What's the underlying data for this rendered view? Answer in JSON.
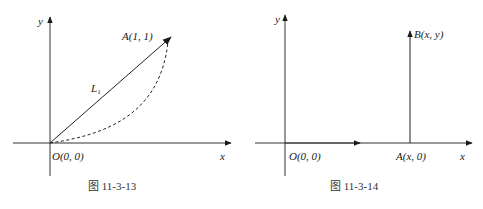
{
  "figures": [
    {
      "id": "fig-11-3-13",
      "caption": "图 11-3-13",
      "axis_labels": {
        "x": "x",
        "y": "y"
      },
      "points": {
        "origin": {
          "label": "O(0, 0)"
        },
        "A": {
          "label": "A(1, 1)"
        }
      },
      "paths": {
        "L1": {
          "label_main": "L",
          "label_sub": "1",
          "style": "solid",
          "description": "straight segment from O to A with arrowhead at A"
        },
        "curve": {
          "style": "dashed",
          "description": "curved path from O bowing below L1, ending at A"
        }
      },
      "colors": {
        "line": "#222222",
        "background": "#ffffff"
      }
    },
    {
      "id": "fig-11-3-14",
      "caption": "图 11-3-14",
      "axis_labels": {
        "x": "x",
        "y": "y"
      },
      "points": {
        "origin": {
          "label": "O(0, 0)"
        },
        "A": {
          "label": "A(x, 0)"
        },
        "B": {
          "label": "B(x, y)"
        }
      },
      "paths": {
        "OA": {
          "style": "solid",
          "description": "along x-axis from O to A with mid-arrow"
        },
        "AB": {
          "style": "solid",
          "description": "vertical segment from A up to B with arrowhead at B"
        }
      },
      "colors": {
        "line": "#222222",
        "background": "#ffffff"
      }
    }
  ]
}
